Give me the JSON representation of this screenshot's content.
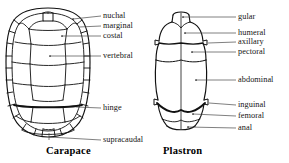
{
  "figure": {
    "title_hidden": "",
    "stroke_color": "#111111",
    "background_color": "#ffffff",
    "leader_color": "#3b3b3b",
    "panels": [
      {
        "id": "carapace",
        "caption": "Carapace",
        "caption_x": 46,
        "caption_y": 146,
        "labels": [
          {
            "text": "nuchal",
            "x": 104,
            "y": 12,
            "leader_x1": 86,
            "leader_y1": 16,
            "leader_x2": 101,
            "leader_y2": 16,
            "dot_x": 73,
            "dot_y": 19
          },
          {
            "text": "marginal",
            "x": 104,
            "y": 22,
            "leader_x1": 80,
            "leader_y1": 26,
            "leader_x2": 101,
            "leader_y2": 26,
            "dot_x": 75,
            "dot_y": 26
          },
          {
            "text": "costal",
            "x": 104,
            "y": 32,
            "leader_x1": 62,
            "leader_y1": 36,
            "leader_x2": 101,
            "leader_y2": 36,
            "dot_x": 62,
            "dot_y": 36
          },
          {
            "text": "vertebral",
            "x": 104,
            "y": 52,
            "leader_x1": 50,
            "leader_y1": 56,
            "leader_x2": 101,
            "leader_y2": 56,
            "dot_x": 50,
            "dot_y": 56
          },
          {
            "text": "hinge",
            "x": 104,
            "y": 104,
            "leader_x1": 76,
            "leader_y1": 108,
            "leader_x2": 101,
            "leader_y2": 108,
            "dot_x": 0,
            "dot_y": 0
          },
          {
            "text": "supracaudal",
            "x": 104,
            "y": 136,
            "leader_x1": 50,
            "leader_y1": 140,
            "leader_x2": 101,
            "leader_y2": 140,
            "dot_x": 0,
            "dot_y": 0
          }
        ]
      },
      {
        "id": "plastron",
        "caption": "Plastron",
        "caption_x": 164,
        "caption_y": 146,
        "labels": [
          {
            "text": "gular",
            "x": 239,
            "y": 13,
            "leader_x1": 196,
            "leader_y1": 17,
            "leader_x2": 236,
            "leader_y2": 17,
            "dot_x": 193,
            "dot_y": 17
          },
          {
            "text": "humeral",
            "x": 239,
            "y": 29,
            "leader_x1": 196,
            "leader_y1": 33,
            "leader_x2": 236,
            "leader_y2": 33,
            "dot_x": 193,
            "dot_y": 33
          },
          {
            "text": "axillary",
            "x": 239,
            "y": 38,
            "leader_x1": 221,
            "leader_y1": 42,
            "leader_x2": 236,
            "leader_y2": 42,
            "dot_x": 0,
            "dot_y": 0
          },
          {
            "text": "pectoral",
            "x": 239,
            "y": 48,
            "leader_x1": 211,
            "leader_y1": 52,
            "leader_x2": 236,
            "leader_y2": 52,
            "dot_x": 209,
            "dot_y": 52
          },
          {
            "text": "abdominal",
            "x": 239,
            "y": 76,
            "leader_x1": 200,
            "leader_y1": 80,
            "leader_x2": 236,
            "leader_y2": 80,
            "dot_x": 198,
            "dot_y": 80
          },
          {
            "text": "inguinal",
            "x": 239,
            "y": 101,
            "leader_x1": 221,
            "leader_y1": 105,
            "leader_x2": 236,
            "leader_y2": 105,
            "dot_x": 0,
            "dot_y": 0
          },
          {
            "text": "femoral",
            "x": 239,
            "y": 112,
            "leader_x1": 200,
            "leader_y1": 116,
            "leader_x2": 236,
            "leader_y2": 116,
            "dot_x": 198,
            "dot_y": 116
          },
          {
            "text": "anal",
            "x": 239,
            "y": 124,
            "leader_x1": 193,
            "leader_y1": 128,
            "leader_x2": 236,
            "leader_y2": 128,
            "dot_x": 190,
            "dot_y": 128
          }
        ]
      }
    ]
  }
}
